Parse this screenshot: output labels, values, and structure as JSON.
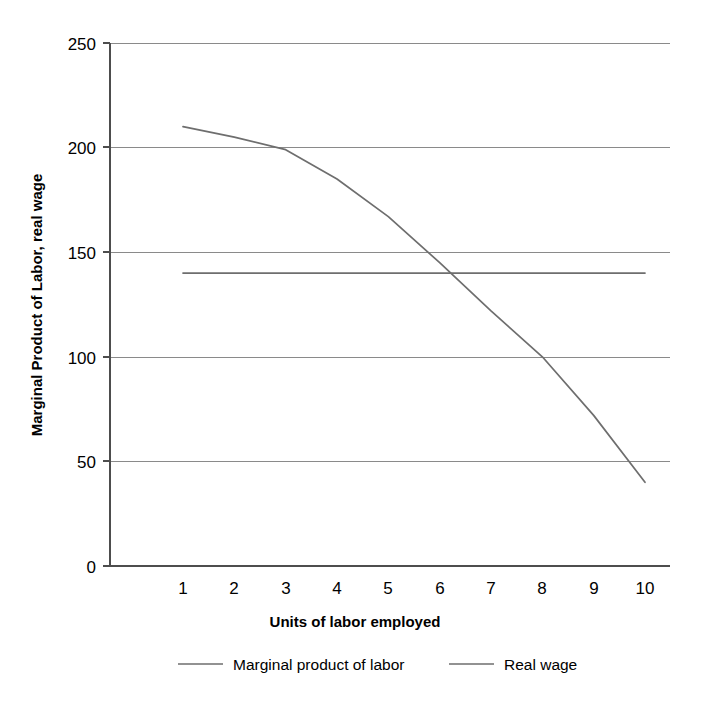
{
  "chart_data": {
    "type": "line",
    "title": "",
    "subtitle": "",
    "xlabel": "Units of labor employed",
    "ylabel": "Marginal Product of Labor, real wage",
    "x": [
      1,
      2,
      3,
      4,
      5,
      6,
      7,
      8,
      9,
      10
    ],
    "xtick_labels": [
      "1",
      "2",
      "3",
      "4",
      "5",
      "6",
      "7",
      "8",
      "9",
      "10"
    ],
    "ytick_labels": [
      "0",
      "50",
      "100",
      "150",
      "200",
      "250"
    ],
    "yticks": [
      0,
      50,
      100,
      150,
      200,
      250
    ],
    "xlim": [
      0.55,
      10.5
    ],
    "ylim": [
      0,
      250
    ],
    "grid": "horizontal",
    "legend_position": "bottom",
    "series": [
      {
        "name": "Marginal product of labor",
        "color": "#6e6e6e",
        "values": [
          210,
          205,
          199,
          185,
          167,
          145,
          122,
          100,
          72,
          40
        ]
      },
      {
        "name": "Real wage",
        "color": "#6e6e6e",
        "values": [
          140,
          140,
          140,
          140,
          140,
          140,
          140,
          140,
          140,
          140
        ]
      }
    ],
    "annotations": []
  },
  "legend": {
    "items": [
      {
        "label": "Marginal product of labor"
      },
      {
        "label": "Real wage"
      }
    ]
  },
  "colors": {
    "gridline": "#8a8a8a",
    "axis": "#4d4d4d",
    "series": "#6e6e6e",
    "text": "#000000",
    "background": "#ffffff"
  }
}
